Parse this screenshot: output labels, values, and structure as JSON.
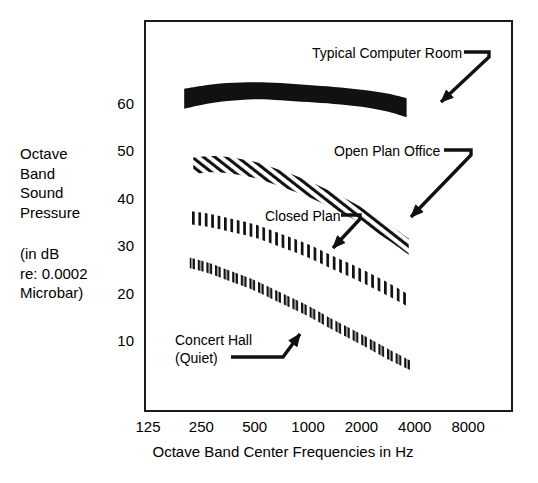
{
  "chart_data": {
    "type": "area",
    "title": "",
    "xlabel": "Octave Band Center Frequencies in Hz",
    "ylabel": "Octave Band Sound Pressure (in dB re: 0.0002 Microbar)",
    "x_tick_labels": [
      "125",
      "250",
      "500",
      "1000",
      "2000",
      "4000",
      "8000"
    ],
    "x_tick_values": [
      125,
      250,
      500,
      1000,
      2000,
      4000,
      8000
    ],
    "x_scale": "log2",
    "y_tick_labels": [
      "60",
      "50",
      "40",
      "30",
      "20",
      "10"
    ],
    "y_tick_values": [
      60,
      50,
      40,
      30,
      20,
      10
    ],
    "ylim": [
      0,
      72
    ],
    "grid": false,
    "legend_position": "inline-annotations",
    "series": [
      {
        "name": "Typical Computer Room",
        "pattern": "solid-black",
        "x": [
          200,
          250,
          350,
          500,
          700,
          1000,
          1400,
          2000,
          2800,
          3600
        ],
        "upper": [
          63.0,
          63.6,
          64.2,
          64.4,
          64.2,
          63.8,
          63.4,
          62.8,
          62.0,
          61.0
        ],
        "lower": [
          58.8,
          59.6,
          60.4,
          60.8,
          60.6,
          60.2,
          59.8,
          59.2,
          58.2,
          57.0
        ]
      },
      {
        "name": "Open Plan Office",
        "pattern": "diagonal-hatch",
        "x": [
          225,
          280,
          350,
          500,
          700,
          1000,
          1400,
          2000,
          2800,
          3700
        ],
        "upper": [
          48.5,
          48.8,
          48.6,
          47.6,
          45.8,
          43.6,
          41.0,
          38.0,
          34.6,
          31.4
        ],
        "lower": [
          45.0,
          45.4,
          45.2,
          44.2,
          42.4,
          40.2,
          37.6,
          34.6,
          31.2,
          28.0
        ]
      },
      {
        "name": "Closed Plan",
        "pattern": "vertical-hatch",
        "x": [
          215,
          280,
          350,
          500,
          700,
          1000,
          1400,
          2000,
          2800,
          3700
        ],
        "upper": [
          37.2,
          36.6,
          35.8,
          34.4,
          32.4,
          30.2,
          27.6,
          25.0,
          22.2,
          19.6
        ],
        "lower": [
          34.4,
          33.8,
          33.0,
          31.6,
          29.6,
          27.4,
          24.8,
          22.2,
          19.4,
          17.0
        ]
      },
      {
        "name": "Concert Hall (Quiet)",
        "pattern": "short-double-ticks",
        "x": [
          215,
          280,
          350,
          500,
          700,
          1000,
          1400,
          2000,
          2800,
          3800
        ],
        "upper": [
          27.4,
          26.2,
          24.8,
          22.6,
          20.0,
          17.2,
          14.2,
          11.2,
          8.2,
          5.6
        ],
        "lower": [
          25.2,
          24.0,
          22.6,
          20.4,
          17.8,
          15.0,
          12.0,
          9.0,
          6.0,
          3.6
        ]
      }
    ],
    "annotations": [
      {
        "label": "Typical Computer Room",
        "target_series": "Typical Computer Room"
      },
      {
        "label": "Open Plan Office",
        "target_series": "Open Plan Office"
      },
      {
        "label": "Closed Plan",
        "target_series": "Closed Plan"
      },
      {
        "label": "Concert Hall",
        "target_series": "Concert Hall (Quiet)"
      },
      {
        "label": "(Quiet)",
        "target_series": "Concert Hall (Quiet)"
      }
    ]
  },
  "axis": {
    "y_label_lines_group1": [
      "Octave",
      "Band",
      "Sound",
      "Pressure"
    ],
    "y_label_lines_group2": [
      "(in dB",
      "re: 0.0002",
      "Microbar)"
    ],
    "x_title": "Octave Band Center Frequencies in Hz"
  },
  "colors": {
    "ink": "#1a1a1a",
    "background": "#ffffff"
  }
}
